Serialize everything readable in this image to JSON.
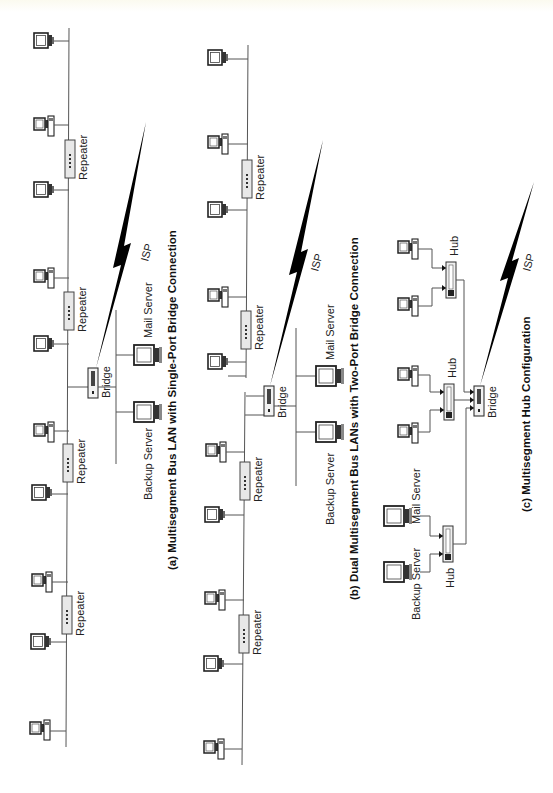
{
  "diagrams": [
    {
      "id": "a",
      "caption": "(a) Multisegment Bus LAN with Single-Port Bridge Connection",
      "labels": {
        "repeater": "Repeater",
        "bridge": "Bridge",
        "isp": "ISP",
        "mail_server": "Mail Server",
        "backup_server": "Backup Server"
      },
      "repeater_count": 4,
      "workstation_count": 10
    },
    {
      "id": "b",
      "caption": "(b) Dual Multisegment Bus LANs with Two-Port Bridge Connection",
      "labels": {
        "repeater": "Repeater",
        "bridge": "Bridge",
        "isp": "ISP",
        "mail_server": "Mail Server",
        "backup_server": "Backup Server"
      },
      "repeater_count": 4,
      "workstation_count": 10
    },
    {
      "id": "c",
      "caption": "(c) Multisegment Hub Configuration",
      "labels": {
        "hub": "Hub",
        "bridge": "Bridge",
        "isp": "ISP",
        "mail_server": "Mail Server",
        "backup_server": "Backup Server"
      },
      "hub_count": 3,
      "workstation_count": 4
    }
  ]
}
